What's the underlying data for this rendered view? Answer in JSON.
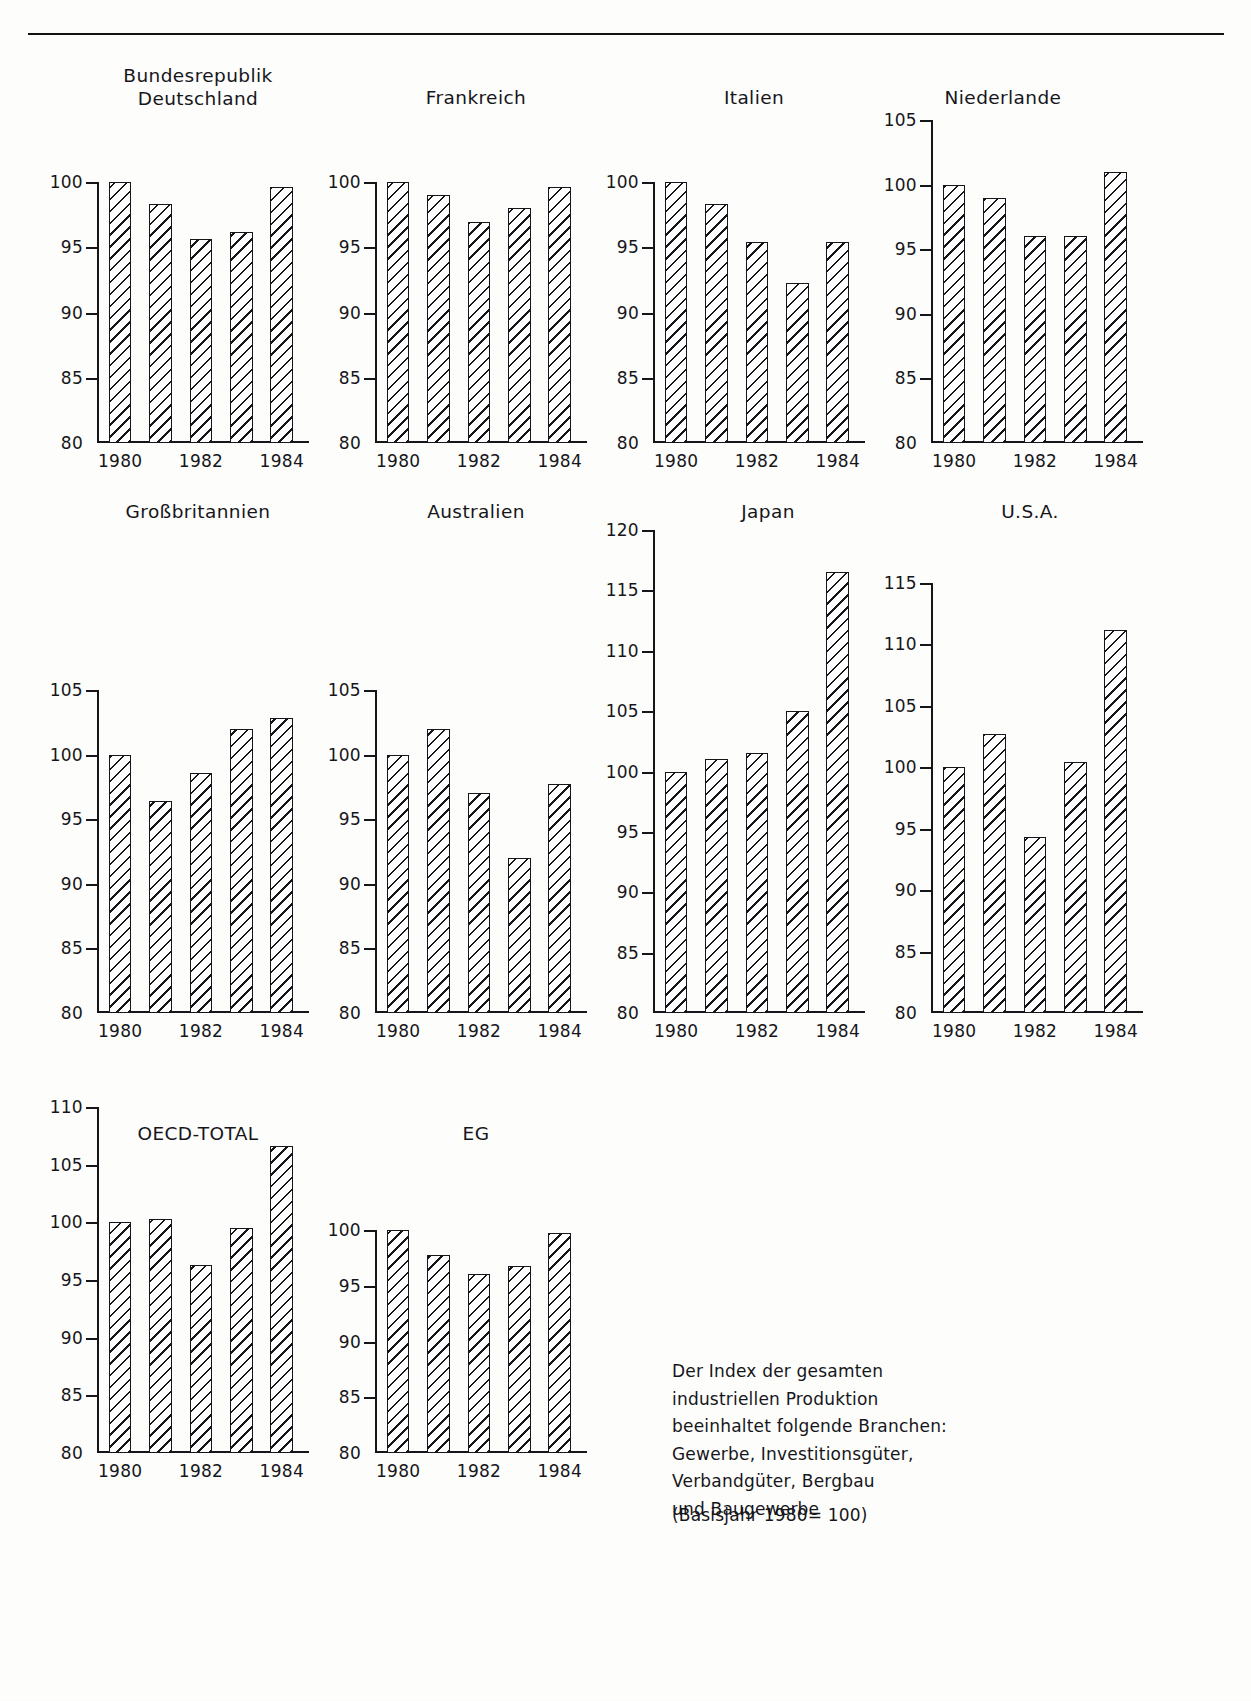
{
  "figure": {
    "note_text": "Der Index der gesamten\nindustriellen Produktion\nbeeinhaltet folgende Branchen:\nGewerbe, Investitionsgüter,\nVerbandgüter, Bergbau\nund Baugewerbe",
    "basis_text": "(Basisjahr 1980= 100)",
    "ink_color": "#15151a",
    "page_color": "#fdfdfc"
  },
  "chart_data": [
    {
      "type": "bar",
      "title": "Bundesrepublik\nDeutschland",
      "categories": [
        "1980",
        "1981",
        "1982",
        "1983",
        "1984"
      ],
      "xtick_labels": [
        "1980",
        "1982",
        "1984"
      ],
      "values": [
        100.0,
        98.3,
        95.6,
        96.2,
        99.6
      ],
      "ylim": [
        80,
        100
      ],
      "yticks": [
        80,
        85,
        90,
        95,
        100
      ],
      "ytick_labels": [
        "80",
        "85",
        "90",
        "95",
        "100"
      ],
      "xlabel": "",
      "ylabel": "",
      "grid": false,
      "legend": "none"
    },
    {
      "type": "bar",
      "title": "Frankreich",
      "categories": [
        "1980",
        "1981",
        "1982",
        "1983",
        "1984"
      ],
      "xtick_labels": [
        "1980",
        "1982",
        "1984"
      ],
      "values": [
        100.0,
        99.0,
        96.9,
        98.0,
        99.6
      ],
      "ylim": [
        80,
        100
      ],
      "yticks": [
        80,
        85,
        90,
        95,
        100
      ],
      "ytick_labels": [
        "80",
        "85",
        "90",
        "95",
        "100"
      ],
      "xlabel": "",
      "ylabel": "",
      "grid": false,
      "legend": "none"
    },
    {
      "type": "bar",
      "title": "Italien",
      "categories": [
        "1980",
        "1981",
        "1982",
        "1983",
        "1984"
      ],
      "xtick_labels": [
        "1980",
        "1982",
        "1984"
      ],
      "values": [
        100.0,
        98.3,
        95.4,
        92.3,
        95.4
      ],
      "ylim": [
        80,
        100
      ],
      "yticks": [
        80,
        85,
        90,
        95,
        100
      ],
      "ytick_labels": [
        "80",
        "85",
        "90",
        "95",
        "100"
      ],
      "xlabel": "",
      "ylabel": "",
      "grid": false,
      "legend": "none"
    },
    {
      "type": "bar",
      "title": "Niederlande",
      "categories": [
        "1980",
        "1981",
        "1982",
        "1983",
        "1984"
      ],
      "xtick_labels": [
        "1980",
        "1982",
        "1984"
      ],
      "values": [
        100.0,
        99.0,
        96.0,
        96.0,
        101.0
      ],
      "ylim": [
        80,
        105
      ],
      "yticks": [
        80,
        85,
        90,
        95,
        100,
        105
      ],
      "ytick_labels": [
        "80",
        "85",
        "90",
        "95",
        "100",
        "105"
      ],
      "xlabel": "",
      "ylabel": "",
      "grid": false,
      "legend": "none"
    },
    {
      "type": "bar",
      "title": "Großbritannien",
      "categories": [
        "1980",
        "1981",
        "1982",
        "1983",
        "1984"
      ],
      "xtick_labels": [
        "1980",
        "1982",
        "1984"
      ],
      "values": [
        100.0,
        96.4,
        98.6,
        102.0,
        102.8
      ],
      "ylim": [
        80,
        105
      ],
      "yticks": [
        80,
        85,
        90,
        95,
        100,
        105
      ],
      "ytick_labels": [
        "80",
        "85",
        "90",
        "95",
        "100",
        "105"
      ],
      "xlabel": "",
      "ylabel": "",
      "grid": false,
      "legend": "none"
    },
    {
      "type": "bar",
      "title": "Australien",
      "categories": [
        "1980",
        "1981",
        "1982",
        "1983",
        "1984"
      ],
      "xtick_labels": [
        "1980",
        "1982",
        "1984"
      ],
      "values": [
        100.0,
        102.0,
        97.0,
        92.0,
        97.7
      ],
      "ylim": [
        80,
        105
      ],
      "yticks": [
        80,
        85,
        90,
        95,
        100,
        105
      ],
      "ytick_labels": [
        "80",
        "85",
        "90",
        "95",
        "100",
        "105"
      ],
      "xlabel": "",
      "ylabel": "",
      "grid": false,
      "legend": "none"
    },
    {
      "type": "bar",
      "title": "Japan",
      "categories": [
        "1980",
        "1981",
        "1982",
        "1983",
        "1984"
      ],
      "xtick_labels": [
        "1980",
        "1982",
        "1984"
      ],
      "values": [
        100.0,
        101.0,
        101.5,
        105.0,
        116.5
      ],
      "ylim": [
        80,
        120
      ],
      "yticks": [
        80,
        85,
        90,
        95,
        100,
        105,
        110,
        115,
        120
      ],
      "ytick_labels": [
        "80",
        "85",
        "90",
        "95",
        "100",
        "105",
        "110",
        "115",
        "120"
      ],
      "xlabel": "",
      "ylabel": "",
      "grid": false,
      "legend": "none"
    },
    {
      "type": "bar",
      "title": "U.S.A.",
      "categories": [
        "1980",
        "1981",
        "1982",
        "1983",
        "1984"
      ],
      "xtick_labels": [
        "1980",
        "1982",
        "1984"
      ],
      "values": [
        100.0,
        102.7,
        94.3,
        100.4,
        111.2
      ],
      "ylim": [
        80,
        115
      ],
      "yticks": [
        80,
        85,
        90,
        95,
        100,
        105,
        110,
        115
      ],
      "ytick_labels": [
        "80",
        "85",
        "90",
        "95",
        "100",
        "105",
        "110",
        "115"
      ],
      "xlabel": "",
      "ylabel": "",
      "grid": false,
      "legend": "none"
    },
    {
      "type": "bar",
      "title": "OECD-TOTAL",
      "categories": [
        "1980",
        "1981",
        "1982",
        "1983",
        "1984"
      ],
      "xtick_labels": [
        "1980",
        "1982",
        "1984"
      ],
      "values": [
        100.0,
        100.3,
        96.3,
        99.5,
        106.6
      ],
      "ylim": [
        80,
        110
      ],
      "yticks": [
        80,
        85,
        90,
        95,
        100,
        105,
        110
      ],
      "ytick_labels": [
        "80",
        "85",
        "90",
        "95",
        "100",
        "105",
        "110"
      ],
      "xlabel": "",
      "ylabel": "",
      "grid": false,
      "legend": "none"
    },
    {
      "type": "bar",
      "title": "EG",
      "categories": [
        "1980",
        "1981",
        "1982",
        "1983",
        "1984"
      ],
      "xtick_labels": [
        "1980",
        "1982",
        "1984"
      ],
      "values": [
        100.0,
        97.8,
        96.1,
        96.8,
        99.7
      ],
      "ylim": [
        80,
        100
      ],
      "yticks": [
        80,
        85,
        90,
        95,
        100
      ],
      "ytick_labels": [
        "80",
        "85",
        "90",
        "95",
        "100"
      ],
      "xlabel": "",
      "ylabel": "",
      "grid": false,
      "legend": "none"
    }
  ],
  "layout": {
    "panels": [
      {
        "key": 0,
        "plot_x": 97,
        "plot_y": 182,
        "plot_w": 202,
        "plot_h": 261,
        "title_x": 198,
        "title_y": 64,
        "title_w": 260
      },
      {
        "key": 1,
        "plot_x": 375,
        "plot_y": 182,
        "plot_w": 202,
        "plot_h": 261,
        "title_x": 476,
        "title_y": 86,
        "title_w": 240
      },
      {
        "key": 2,
        "plot_x": 653,
        "plot_y": 182,
        "plot_w": 202,
        "plot_h": 261,
        "title_x": 754,
        "title_y": 86,
        "title_w": 240
      },
      {
        "key": 3,
        "plot_x": 931,
        "plot_y": 120,
        "plot_w": 202,
        "plot_h": 323,
        "title_x": 1003,
        "title_y": 86,
        "title_w": 240
      },
      {
        "key": 4,
        "plot_x": 97,
        "plot_y": 690,
        "plot_w": 202,
        "plot_h": 323,
        "title_x": 198,
        "title_y": 500,
        "title_w": 260
      },
      {
        "key": 5,
        "plot_x": 375,
        "plot_y": 690,
        "plot_w": 202,
        "plot_h": 323,
        "title_x": 476,
        "title_y": 500,
        "title_w": 240
      },
      {
        "key": 6,
        "plot_x": 653,
        "plot_y": 530,
        "plot_w": 202,
        "plot_h": 483,
        "title_x": 768,
        "title_y": 500,
        "title_w": 200
      },
      {
        "key": 7,
        "plot_x": 931,
        "plot_y": 583,
        "plot_w": 202,
        "plot_h": 430,
        "title_x": 1030,
        "title_y": 500,
        "title_w": 200
      },
      {
        "key": 8,
        "plot_x": 97,
        "plot_y": 1107,
        "plot_w": 202,
        "plot_h": 346,
        "title_x": 198,
        "title_y": 1122,
        "title_w": 240
      },
      {
        "key": 9,
        "plot_x": 375,
        "plot_y": 1230,
        "plot_w": 202,
        "plot_h": 223,
        "title_x": 476,
        "title_y": 1122,
        "title_w": 160
      }
    ],
    "note_x": 672,
    "note_y": 1358,
    "basis_x": 672,
    "basis_y": 1505
  }
}
